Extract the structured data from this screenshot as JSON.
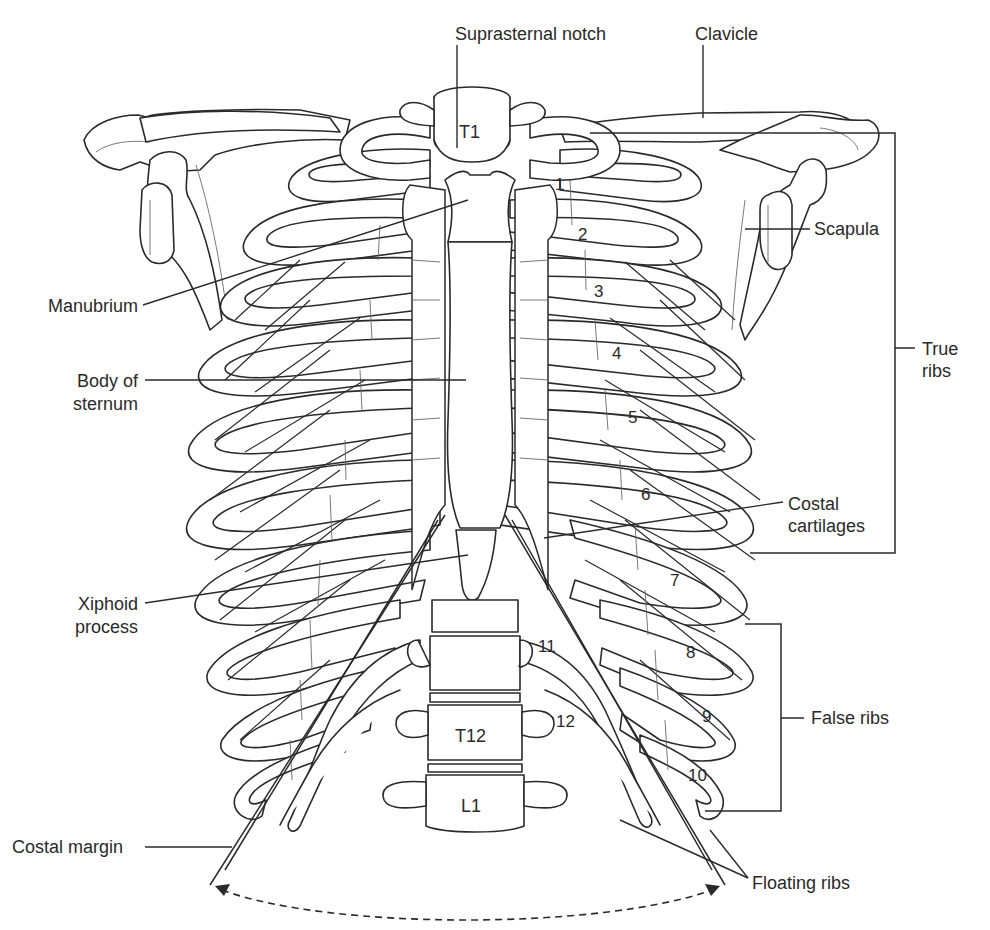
{
  "figure": {
    "labels": {
      "suprasternal_notch": "Suprasternal notch",
      "clavicle": "Clavicle",
      "scapula": "Scapula",
      "manubrium": "Manubrium",
      "body_of_sternum_line1": "Body of",
      "body_of_sternum_line2": "sternum",
      "true_ribs_line1": "True",
      "true_ribs_line2": "ribs",
      "costal_cartilages_line1": "Costal",
      "costal_cartilages_line2": "cartilages",
      "xiphoid_line1": "Xiphoid",
      "xiphoid_line2": "process",
      "false_ribs": "False ribs",
      "costal_margin": "Costal margin",
      "floating_ribs": "Floating ribs"
    },
    "vertebrae": {
      "t1": "T1",
      "t12": "T12",
      "l1": "L1"
    },
    "rib_numbers": [
      "1",
      "2",
      "3",
      "4",
      "5",
      "6",
      "7",
      "8",
      "9",
      "10",
      "11",
      "12"
    ],
    "groups": {
      "true_ribs": "Ribs 1–7",
      "false_ribs": "Ribs 8–10",
      "floating_ribs": "Ribs 11–12"
    }
  }
}
